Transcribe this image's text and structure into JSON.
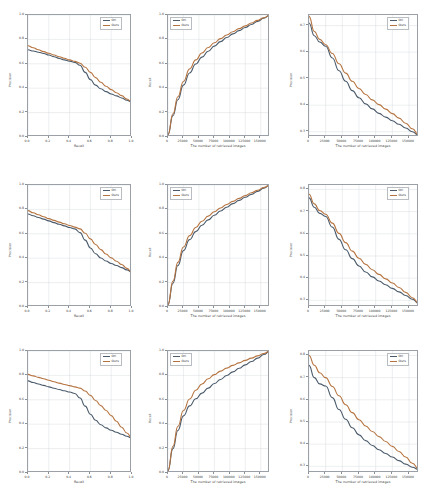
{
  "figure": {
    "rows": 3,
    "cols": 3,
    "series_names": [
      "Ori",
      "Ours"
    ],
    "colors": {
      "ori": "#4a5a6a",
      "ours": "#b5733f",
      "axis": "#9aa0a6",
      "grid": "#d8dce0",
      "text": "#3c3c3c"
    }
  },
  "chart_data": [
    {
      "id": "r1c1",
      "type": "line",
      "title": "",
      "xlabel": "Recall",
      "ylabel": "Precision",
      "xlim": [
        0.0,
        1.0
      ],
      "ylim": [
        0.0,
        1.0
      ],
      "xticks": [
        "0.0",
        "0.2",
        "0.4",
        "0.6",
        "0.8",
        "1.0"
      ],
      "yticks": [
        "0.0",
        "0.2",
        "0.4",
        "0.6",
        "0.8",
        "1.0"
      ],
      "grid": true,
      "legend_position": "upper right",
      "x": [
        0.0,
        0.05,
        0.1,
        0.15,
        0.2,
        0.25,
        0.3,
        0.35,
        0.4,
        0.45,
        0.5,
        0.55,
        0.6,
        0.65,
        0.7,
        0.75,
        0.8,
        0.85,
        0.9,
        0.95,
        1.0
      ],
      "series": [
        {
          "name": "Ori",
          "values": [
            0.715,
            0.705,
            0.695,
            0.685,
            0.672,
            0.658,
            0.644,
            0.632,
            0.622,
            0.612,
            0.588,
            0.53,
            0.47,
            0.425,
            0.395,
            0.372,
            0.353,
            0.337,
            0.32,
            0.302,
            0.285
          ]
        },
        {
          "name": "Ours",
          "values": [
            0.748,
            0.732,
            0.715,
            0.7,
            0.686,
            0.672,
            0.658,
            0.645,
            0.632,
            0.62,
            0.605,
            0.572,
            0.53,
            0.487,
            0.449,
            0.416,
            0.388,
            0.363,
            0.339,
            0.312,
            0.285
          ]
        }
      ]
    },
    {
      "id": "r1c2",
      "type": "line",
      "title": "",
      "xlabel": "The number of retrieved images",
      "ylabel": "Recall",
      "xlim": [
        0,
        165000
      ],
      "ylim": [
        0.0,
        1.0
      ],
      "xticks": [
        "0",
        "25000",
        "50000",
        "75000",
        "100000",
        "125000",
        "150000"
      ],
      "yticks": [
        "0.0",
        "0.2",
        "0.4",
        "0.6",
        "0.8",
        "1.0"
      ],
      "grid": true,
      "legend_position": "upper left",
      "x": [
        0,
        8000,
        16000,
        25000,
        35000,
        45000,
        55000,
        65000,
        75000,
        85000,
        95000,
        105000,
        115000,
        125000,
        135000,
        145000,
        155000,
        165000
      ],
      "series": [
        {
          "name": "Ori",
          "values": [
            0.02,
            0.175,
            0.305,
            0.425,
            0.525,
            0.598,
            0.655,
            0.703,
            0.745,
            0.782,
            0.815,
            0.845,
            0.872,
            0.898,
            0.922,
            0.948,
            0.974,
            1.0
          ]
        },
        {
          "name": "Ours",
          "values": [
            0.02,
            0.19,
            0.33,
            0.455,
            0.558,
            0.632,
            0.688,
            0.733,
            0.772,
            0.806,
            0.836,
            0.863,
            0.888,
            0.911,
            0.934,
            0.956,
            0.978,
            1.0
          ]
        }
      ]
    },
    {
      "id": "r1c3",
      "type": "line",
      "title": "",
      "xlabel": "The number of retrieved images",
      "ylabel": "Precision",
      "xlim": [
        0,
        165000
      ],
      "ylim": [
        0.28,
        0.74
      ],
      "xticks": [
        "0",
        "25000",
        "50000",
        "75000",
        "100000",
        "125000",
        "150000"
      ],
      "yticks": [
        "0.3",
        "0.4",
        "0.5",
        "0.6",
        "0.7"
      ],
      "grid": true,
      "legend_position": "upper right",
      "x": [
        0,
        8000,
        16000,
        25000,
        35000,
        45000,
        55000,
        65000,
        75000,
        85000,
        95000,
        105000,
        115000,
        125000,
        135000,
        145000,
        155000,
        165000
      ],
      "series": [
        {
          "name": "Ori",
          "values": [
            0.71,
            0.662,
            0.638,
            0.622,
            0.578,
            0.53,
            0.49,
            0.455,
            0.428,
            0.405,
            0.386,
            0.369,
            0.355,
            0.341,
            0.328,
            0.314,
            0.3,
            0.285
          ]
        },
        {
          "name": "Ours",
          "values": [
            0.735,
            0.678,
            0.648,
            0.628,
            0.595,
            0.556,
            0.521,
            0.49,
            0.463,
            0.44,
            0.42,
            0.402,
            0.385,
            0.368,
            0.351,
            0.332,
            0.311,
            0.287
          ]
        }
      ]
    },
    {
      "id": "r2c1",
      "type": "line",
      "title": "",
      "xlabel": "Recall",
      "ylabel": "Precision",
      "xlim": [
        0.0,
        1.0
      ],
      "ylim": [
        0.0,
        1.0
      ],
      "xticks": [
        "0.0",
        "0.2",
        "0.4",
        "0.6",
        "0.8",
        "1.0"
      ],
      "yticks": [
        "0.0",
        "0.2",
        "0.4",
        "0.6",
        "0.8",
        "1.0"
      ],
      "grid": true,
      "legend_position": "upper right",
      "x": [
        0.0,
        0.05,
        0.1,
        0.15,
        0.2,
        0.25,
        0.3,
        0.35,
        0.4,
        0.45,
        0.5,
        0.55,
        0.6,
        0.65,
        0.7,
        0.75,
        0.8,
        0.85,
        0.9,
        0.95,
        1.0
      ],
      "series": [
        {
          "name": "Ori",
          "values": [
            0.762,
            0.748,
            0.734,
            0.72,
            0.706,
            0.692,
            0.678,
            0.665,
            0.652,
            0.64,
            0.61,
            0.548,
            0.484,
            0.436,
            0.402,
            0.377,
            0.357,
            0.34,
            0.323,
            0.304,
            0.285
          ]
        },
        {
          "name": "Ours",
          "values": [
            0.79,
            0.772,
            0.756,
            0.74,
            0.724,
            0.71,
            0.696,
            0.682,
            0.668,
            0.655,
            0.64,
            0.604,
            0.558,
            0.512,
            0.47,
            0.434,
            0.403,
            0.375,
            0.348,
            0.317,
            0.285
          ]
        }
      ]
    },
    {
      "id": "r2c2",
      "type": "line",
      "title": "",
      "xlabel": "The number of retrieved images",
      "ylabel": "Recall",
      "xlim": [
        0,
        165000
      ],
      "ylim": [
        0.0,
        1.0
      ],
      "xticks": [
        "0",
        "25000",
        "50000",
        "75000",
        "100000",
        "125000",
        "150000"
      ],
      "yticks": [
        "0.0",
        "0.2",
        "0.4",
        "0.6",
        "0.8",
        "1.0"
      ],
      "grid": true,
      "legend_position": "upper left",
      "x": [
        0,
        8000,
        16000,
        25000,
        35000,
        45000,
        55000,
        65000,
        75000,
        85000,
        95000,
        105000,
        115000,
        125000,
        135000,
        145000,
        155000,
        165000
      ],
      "series": [
        {
          "name": "Ori",
          "values": [
            0.02,
            0.195,
            0.34,
            0.462,
            0.552,
            0.618,
            0.67,
            0.714,
            0.752,
            0.787,
            0.818,
            0.847,
            0.874,
            0.899,
            0.923,
            0.948,
            0.974,
            1.0
          ]
        },
        {
          "name": "Ours",
          "values": [
            0.02,
            0.212,
            0.366,
            0.492,
            0.585,
            0.652,
            0.703,
            0.745,
            0.781,
            0.812,
            0.84,
            0.866,
            0.89,
            0.913,
            0.936,
            0.957,
            0.979,
            1.0
          ]
        }
      ]
    },
    {
      "id": "r2c3",
      "type": "line",
      "title": "",
      "xlabel": "The number of retrieved images",
      "ylabel": "Precision",
      "xlim": [
        0,
        165000
      ],
      "ylim": [
        0.27,
        0.82
      ],
      "xticks": [
        "0",
        "25000",
        "50000",
        "75000",
        "100000",
        "125000",
        "150000"
      ],
      "yticks": [
        "0.3",
        "0.4",
        "0.5",
        "0.6",
        "0.7",
        "0.8"
      ],
      "grid": true,
      "legend_position": "upper right",
      "x": [
        0,
        8000,
        16000,
        25000,
        35000,
        45000,
        55000,
        65000,
        75000,
        85000,
        95000,
        105000,
        115000,
        125000,
        135000,
        145000,
        155000,
        165000
      ],
      "series": [
        {
          "name": "Ori",
          "values": [
            0.762,
            0.72,
            0.692,
            0.678,
            0.63,
            0.575,
            0.528,
            0.488,
            0.455,
            0.428,
            0.406,
            0.387,
            0.37,
            0.354,
            0.338,
            0.322,
            0.305,
            0.285
          ]
        },
        {
          "name": "Ours",
          "values": [
            0.778,
            0.735,
            0.705,
            0.688,
            0.648,
            0.602,
            0.56,
            0.522,
            0.49,
            0.462,
            0.438,
            0.417,
            0.397,
            0.378,
            0.358,
            0.336,
            0.312,
            0.287
          ]
        }
      ]
    },
    {
      "id": "r3c1",
      "type": "line",
      "title": "",
      "xlabel": "Recall",
      "ylabel": "Precision",
      "xlim": [
        0.0,
        1.0
      ],
      "ylim": [
        0.0,
        1.0
      ],
      "xticks": [
        "0.0",
        "0.2",
        "0.4",
        "0.6",
        "0.8",
        "1.0"
      ],
      "yticks": [
        "0.0",
        "0.2",
        "0.4",
        "0.6",
        "0.8",
        "1.0"
      ],
      "grid": true,
      "legend_position": "upper right",
      "x": [
        0.0,
        0.05,
        0.1,
        0.15,
        0.2,
        0.25,
        0.3,
        0.35,
        0.4,
        0.45,
        0.5,
        0.55,
        0.6,
        0.65,
        0.7,
        0.75,
        0.8,
        0.85,
        0.9,
        0.95,
        1.0
      ],
      "series": [
        {
          "name": "Ori",
          "values": [
            0.755,
            0.742,
            0.73,
            0.718,
            0.706,
            0.695,
            0.684,
            0.674,
            0.664,
            0.652,
            0.615,
            0.548,
            0.482,
            0.432,
            0.396,
            0.37,
            0.35,
            0.334,
            0.318,
            0.301,
            0.285
          ]
        },
        {
          "name": "Ours",
          "values": [
            0.808,
            0.796,
            0.784,
            0.772,
            0.76,
            0.748,
            0.737,
            0.726,
            0.716,
            0.706,
            0.696,
            0.672,
            0.636,
            0.594,
            0.552,
            0.512,
            0.47,
            0.424,
            0.375,
            0.328,
            0.285
          ]
        }
      ]
    },
    {
      "id": "r3c2",
      "type": "line",
      "title": "",
      "xlabel": "The number of retrieved images",
      "ylabel": "Recall",
      "xlim": [
        0,
        165000
      ],
      "ylim": [
        0.0,
        1.0
      ],
      "xticks": [
        "0",
        "25000",
        "50000",
        "75000",
        "100000",
        "125000",
        "150000"
      ],
      "yticks": [
        "0.0",
        "0.2",
        "0.4",
        "0.6",
        "0.8",
        "1.0"
      ],
      "grid": true,
      "legend_position": "upper left",
      "x": [
        0,
        8000,
        16000,
        25000,
        35000,
        45000,
        55000,
        65000,
        75000,
        85000,
        95000,
        105000,
        115000,
        125000,
        135000,
        145000,
        155000,
        165000
      ],
      "series": [
        {
          "name": "Ori",
          "values": [
            0.02,
            0.2,
            0.348,
            0.468,
            0.55,
            0.608,
            0.655,
            0.696,
            0.733,
            0.767,
            0.799,
            0.829,
            0.858,
            0.886,
            0.914,
            0.942,
            0.971,
            1.0
          ]
        },
        {
          "name": "Ours",
          "values": [
            0.02,
            0.218,
            0.382,
            0.512,
            0.606,
            0.678,
            0.73,
            0.772,
            0.806,
            0.835,
            0.86,
            0.882,
            0.903,
            0.923,
            0.942,
            0.96,
            0.98,
            1.0
          ]
        }
      ]
    },
    {
      "id": "r3c3",
      "type": "line",
      "title": "",
      "xlabel": "The number of retrieved images",
      "ylabel": "Precision",
      "xlim": [
        0,
        165000
      ],
      "ylim": [
        0.27,
        0.82
      ],
      "xticks": [
        "0",
        "25000",
        "50000",
        "75000",
        "100000",
        "125000",
        "150000"
      ],
      "yticks": [
        "0.3",
        "0.4",
        "0.5",
        "0.6",
        "0.7",
        "0.8"
      ],
      "grid": true,
      "legend_position": "upper right",
      "x": [
        0,
        8000,
        16000,
        25000,
        35000,
        45000,
        55000,
        65000,
        75000,
        85000,
        95000,
        105000,
        115000,
        125000,
        135000,
        145000,
        155000,
        165000
      ],
      "series": [
        {
          "name": "Ori",
          "values": [
            0.755,
            0.7,
            0.672,
            0.662,
            0.61,
            0.556,
            0.512,
            0.474,
            0.442,
            0.416,
            0.394,
            0.375,
            0.358,
            0.342,
            0.326,
            0.31,
            0.296,
            0.285
          ]
        },
        {
          "name": "Ours",
          "values": [
            0.8,
            0.756,
            0.722,
            0.7,
            0.66,
            0.618,
            0.578,
            0.542,
            0.51,
            0.482,
            0.457,
            0.434,
            0.412,
            0.39,
            0.367,
            0.342,
            0.314,
            0.287
          ]
        }
      ]
    }
  ]
}
